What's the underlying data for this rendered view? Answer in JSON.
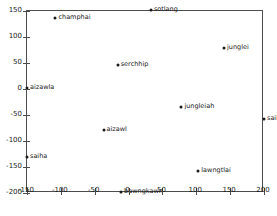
{
  "chart_data": {
    "type": "scatter",
    "title": "",
    "xlabel": "",
    "ylabel": "",
    "xlim": [
      -150,
      200
    ],
    "ylim": [
      -200,
      150
    ],
    "grid": false,
    "legend": null,
    "xticks": [
      -150,
      -100,
      -50,
      0,
      50,
      100,
      150,
      200
    ],
    "xtick_labels": [
      "-150",
      "-100",
      "-50",
      "0",
      "50",
      "100",
      "150",
      "200"
    ],
    "yticks": [
      -200,
      -150,
      -100,
      -50,
      0,
      50,
      100,
      150
    ],
    "ytick_labels": [
      "-200",
      "-150",
      "-100",
      "-50",
      "0",
      "50",
      "100",
      "150"
    ],
    "marker": "point",
    "marker_color": "#1a1a1a",
    "points": [
      {
        "label": "sotlang",
        "x": 33,
        "y": 152
      },
      {
        "label": "champhai",
        "x": -108,
        "y": 136
      },
      {
        "label": "junglei",
        "x": 141,
        "y": 79
      },
      {
        "label": "serchhip",
        "x": -16,
        "y": 46
      },
      {
        "label": "aizawla",
        "x": -150,
        "y": 2
      },
      {
        "label": "jungleiah",
        "x": 78,
        "y": -34
      },
      {
        "label": "saiha",
        "x": 200,
        "y": -57
      },
      {
        "label": "aizawl",
        "x": -37,
        "y": -79
      },
      {
        "label": "saiha",
        "x": -150,
        "y": -131
      },
      {
        "label": "lawngtlai",
        "x": 103,
        "y": -158
      },
      {
        "label": "bawngkawn",
        "x": -11,
        "y": -199
      }
    ]
  }
}
